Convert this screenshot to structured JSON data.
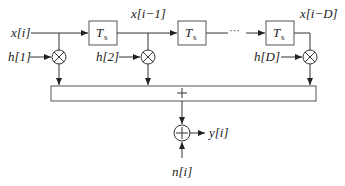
{
  "diagram": {
    "type": "tapped-delay-line channel model",
    "input_label": "x[i]",
    "delay_blocks": [
      {
        "label": "T",
        "subscript": "s"
      },
      {
        "label": "T",
        "subscript": "s"
      },
      {
        "label": "T",
        "subscript": "s"
      }
    ],
    "delayed_signals": [
      "x[i−1]",
      "x[i−D]"
    ],
    "ellipsis": "···",
    "tap_weights": [
      "h[1]",
      "h[2]",
      "h[D]"
    ],
    "multiplier_symbol": "⊗",
    "summer_symbol": "+",
    "noise_adder_symbol": "⊕",
    "noise_label": "n[i]",
    "output_label": "y[i]"
  }
}
